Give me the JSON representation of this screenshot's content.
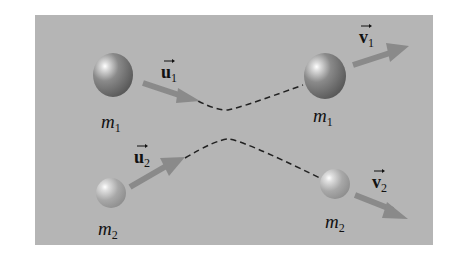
{
  "diagram": {
    "type": "two-body collision (elastic scattering)",
    "background_color": "#b5b5b5",
    "path_style": "dashed",
    "bodies": [
      {
        "id": "m1_initial",
        "label": "m",
        "subscript": "1",
        "position": "top-left"
      },
      {
        "id": "m2_initial",
        "label": "m",
        "subscript": "2",
        "position": "bottom-left"
      },
      {
        "id": "m1_final",
        "label": "m",
        "subscript": "1",
        "position": "top-right"
      },
      {
        "id": "m2_final",
        "label": "m",
        "subscript": "2",
        "position": "bottom-right"
      }
    ],
    "vectors": [
      {
        "id": "u1",
        "label": "u",
        "subscript": "1",
        "description": "initial velocity of m1"
      },
      {
        "id": "u2",
        "label": "u",
        "subscript": "2",
        "description": "initial velocity of m2"
      },
      {
        "id": "v1",
        "label": "v",
        "subscript": "1",
        "description": "final velocity of m1"
      },
      {
        "id": "v2",
        "label": "v",
        "subscript": "2",
        "description": "final velocity of m2"
      }
    ]
  }
}
